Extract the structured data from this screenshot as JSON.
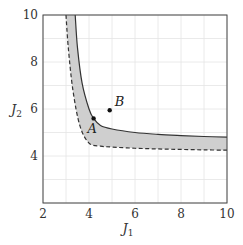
{
  "chart_data": {
    "type": "area",
    "title": "",
    "xlabel": "J1",
    "ylabel": "J2",
    "xlim": [
      2,
      10
    ],
    "ylim": [
      2,
      10
    ],
    "xticks": [
      2,
      4,
      6,
      8,
      10
    ],
    "yticks": [
      4,
      6,
      8,
      10
    ],
    "grid": true,
    "grid_step": 1,
    "legend": null,
    "series": [
      {
        "name": "upper boundary (solid)",
        "style": "solid",
        "x": [
          3.4,
          3.5,
          3.7,
          4.0,
          4.2,
          4.5,
          5.0,
          6.0,
          7.0,
          8.0,
          9.0,
          10.0
        ],
        "y": [
          10.0,
          8.6,
          7.1,
          6.0,
          5.6,
          5.3,
          5.15,
          5.0,
          4.92,
          4.87,
          4.83,
          4.8
        ]
      },
      {
        "name": "lower boundary (dashed)",
        "style": "dashed",
        "x": [
          3.0,
          3.1,
          3.3,
          3.6,
          4.0,
          4.5,
          5.0,
          6.0,
          7.0,
          8.0,
          9.0,
          10.0
        ],
        "y": [
          10.0,
          8.6,
          6.8,
          5.3,
          4.55,
          4.42,
          4.38,
          4.33,
          4.3,
          4.28,
          4.26,
          4.25
        ]
      }
    ],
    "fill_between": {
      "color": "#cccccc",
      "between": [
        "upper boundary (solid)",
        "lower boundary (dashed)"
      ]
    },
    "points": [
      {
        "label": "A",
        "x": 4.2,
        "y": 5.6
      },
      {
        "label": "B",
        "x": 4.9,
        "y": 5.95
      }
    ]
  },
  "labels": {
    "xlabel_main": "J",
    "xlabel_sub": "1",
    "ylabel_main": "J",
    "ylabel_sub": "2",
    "xtick_labels": [
      "2",
      "4",
      "6",
      "8",
      "10"
    ],
    "ytick_labels": [
      "4",
      "6",
      "8",
      "10"
    ],
    "point_a": "A",
    "point_b": "B"
  }
}
